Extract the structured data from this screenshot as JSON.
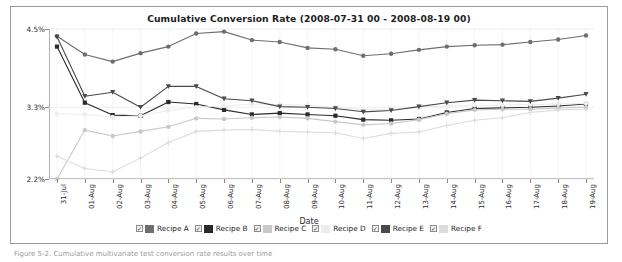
{
  "figure": {
    "title": "Cumulative Conversion Rate (2008-07-31 00 - 2008-08-19 00)",
    "xlabel": "Date",
    "ylabel": "Conversion Rate",
    "caption": "Figure 5-2. Cumulative multivariate test conversion rate results over time"
  },
  "legend": {
    "items": [
      {
        "label": "Recipe A",
        "color": "#6e6e6e",
        "checked": true,
        "check_glyph": "✓"
      },
      {
        "label": "Recipe B",
        "color": "#2b2b2b",
        "checked": true,
        "check_glyph": "✓"
      },
      {
        "label": "Recipe C",
        "color": "#c8c8c8",
        "checked": true,
        "check_glyph": "✓"
      },
      {
        "label": "Recipe D",
        "color": "#ededed",
        "checked": true,
        "check_glyph": "✓"
      },
      {
        "label": "Recipe E",
        "color": "#4a4a4a",
        "checked": true,
        "check_glyph": "✓"
      },
      {
        "label": "Recipe F",
        "color": "#dcdcdc",
        "checked": true,
        "check_glyph": "✓"
      }
    ]
  },
  "chart_data": {
    "type": "line",
    "title": "Cumulative Conversion Rate (2008-07-31 00 - 2008-08-19 00)",
    "xlabel": "Date",
    "ylabel": "Conversion Rate",
    "ylim": [
      2.2,
      4.5
    ],
    "yticks": [
      2.2,
      3.3,
      4.5
    ],
    "ytick_labels": [
      "2.2%",
      "3.3%",
      "4.5%"
    ],
    "grid": true,
    "legend_position": "bottom",
    "x": [
      "31-Jul",
      "01-Aug",
      "02-Aug",
      "03-Aug",
      "04-Aug",
      "05-Aug",
      "06-Aug",
      "07-Aug",
      "08-Aug",
      "09-Aug",
      "10-Aug",
      "11-Aug",
      "12-Aug",
      "13-Aug",
      "14-Aug",
      "15-Aug",
      "16-Aug",
      "17-Aug",
      "18-Aug",
      "19-Aug"
    ],
    "series": [
      {
        "name": "Recipe A",
        "color": "#6e6e6e",
        "marker": "circle",
        "values": [
          4.39,
          4.11,
          4.0,
          4.13,
          4.23,
          4.43,
          4.46,
          4.33,
          4.3,
          4.21,
          4.19,
          4.09,
          4.12,
          4.18,
          4.23,
          4.25,
          4.26,
          4.3,
          4.34,
          4.4
        ]
      },
      {
        "name": "Recipe B",
        "color": "#2b2b2b",
        "marker": "square",
        "values": [
          4.23,
          3.37,
          3.18,
          3.17,
          3.38,
          3.35,
          3.26,
          3.19,
          3.21,
          3.19,
          3.17,
          3.11,
          3.1,
          3.12,
          3.22,
          3.28,
          3.29,
          3.3,
          3.32,
          3.35
        ]
      },
      {
        "name": "Recipe C",
        "color": "#c8c8c8",
        "marker": "circle",
        "values": [
          2.2,
          2.95,
          2.86,
          2.93,
          3.0,
          3.13,
          3.12,
          3.14,
          3.15,
          3.13,
          3.08,
          3.03,
          3.05,
          3.11,
          3.2,
          3.26,
          3.27,
          3.27,
          3.29,
          3.3
        ]
      },
      {
        "name": "Recipe D",
        "color": "#ededed",
        "marker": "circle",
        "values": [
          3.2,
          3.19,
          3.15,
          3.17,
          3.25,
          3.3,
          3.32,
          3.35,
          3.34,
          3.33,
          3.3,
          3.26,
          3.27,
          3.29,
          3.32,
          3.33,
          3.33,
          3.34,
          3.35,
          3.36
        ]
      },
      {
        "name": "Recipe E",
        "color": "#4a4a4a",
        "marker": "triangle",
        "values": [
          4.38,
          3.47,
          3.53,
          3.3,
          3.62,
          3.62,
          3.43,
          3.4,
          3.31,
          3.3,
          3.28,
          3.23,
          3.25,
          3.31,
          3.37,
          3.41,
          3.4,
          3.39,
          3.44,
          3.5
        ]
      },
      {
        "name": "Recipe F",
        "color": "#dcdcdc",
        "marker": "plus",
        "values": [
          2.55,
          2.36,
          2.31,
          2.52,
          2.76,
          2.93,
          2.95,
          2.96,
          2.93,
          2.92,
          2.91,
          2.82,
          2.9,
          2.92,
          3.02,
          3.1,
          3.14,
          3.22,
          3.26,
          3.27
        ]
      }
    ]
  }
}
